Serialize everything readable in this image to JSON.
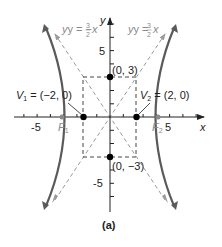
{
  "figure": {
    "caption": "(a)",
    "axes": {
      "x_label": "x",
      "y_label": "y",
      "x_ticks": [
        "-5",
        "5"
      ],
      "y_ticks": [
        "5",
        "-5"
      ],
      "x_range": [
        -7,
        7
      ],
      "y_range": [
        -7,
        7
      ]
    },
    "asymptotes": [
      {
        "label_prefix": "y = −",
        "num": "3",
        "den": "2",
        "suffix": "x"
      },
      {
        "label_prefix": "y = ",
        "num": "3",
        "den": "2",
        "suffix": "x"
      }
    ],
    "points": {
      "v1": {
        "name": "V",
        "sub": "1",
        "text": " = (−2, 0)"
      },
      "v2": {
        "name": "V",
        "sub": "2",
        "text": " = (2, 0)"
      },
      "top": {
        "text": "(0, 3)"
      },
      "bottom": {
        "text": "(0, −3)"
      },
      "f1": {
        "name": "F",
        "sub": "1"
      },
      "f2": {
        "name": "F",
        "sub": "2"
      }
    },
    "colors": {
      "curve": "#5a5a5a",
      "asymptote": "#9a9a9a",
      "axis": "#222222",
      "box": "#444444",
      "focus": "#8a8a8a",
      "point": "#000000"
    }
  }
}
